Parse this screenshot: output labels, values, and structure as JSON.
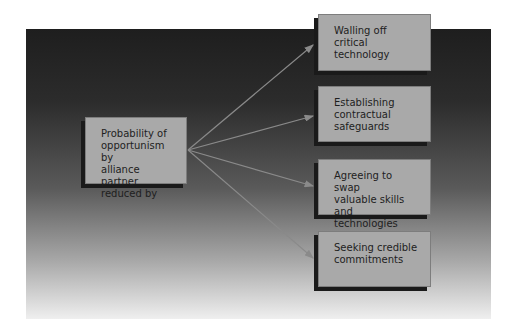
{
  "diagram": {
    "source": {
      "label": "Probability of\nopportunism by\nalliance partner\nreduced by"
    },
    "targets": [
      {
        "label": "Walling off\ncritical technology"
      },
      {
        "label": "Establishing\ncontractual\nsafeguards"
      },
      {
        "label": "Agreeing to swap\nvaluable skills\nand technologies"
      },
      {
        "label": "Seeking credible\ncommitments"
      }
    ],
    "colors": {
      "box_fill": "#a9a9a9",
      "box_shadow": "#1a1a1a",
      "arrow": "#8a8a8a",
      "background_top": "#1e1e1e",
      "background_bottom": "#efefef"
    }
  }
}
